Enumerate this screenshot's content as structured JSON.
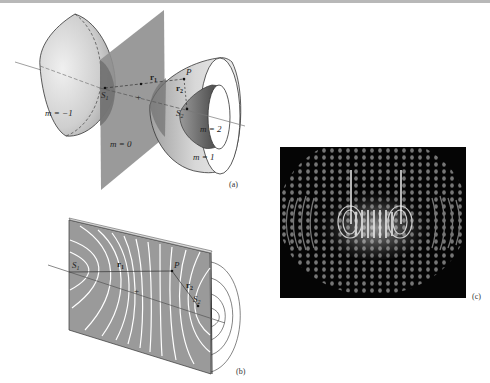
{
  "figure": {
    "panels": [
      {
        "id": "a",
        "label": "(a)",
        "description": "Hyperboloid surfaces of constant path difference between two sources",
        "surfaces": [
          {
            "m_label": "m = −1",
            "m": -1
          },
          {
            "m_label": "m = 0",
            "m": 0
          },
          {
            "m_label": "m = 1",
            "m": 1
          },
          {
            "m_label": "m = 2",
            "m": 2
          }
        ],
        "points": {
          "source1": "S",
          "source1_sub": "1",
          "source2": "S",
          "source2_sub": "2",
          "point": "P"
        },
        "vectors": {
          "r1": "r",
          "r1_sub": "1",
          "r2": "r",
          "r2_sub": "2"
        }
      },
      {
        "id": "b",
        "label": "(b)",
        "description": "Planar cross-section showing hyperbolic fringe lines",
        "points": {
          "source1": "S",
          "source1_sub": "1",
          "source2": "S",
          "source2_sub": "2",
          "point": "P"
        },
        "vectors": {
          "r1": "r",
          "r1_sub": "1",
          "r2": "r",
          "r2_sub": "2"
        }
      },
      {
        "id": "c",
        "label": "(c)",
        "description": "Two-source interference pattern intensity surface"
      }
    ],
    "colors": {
      "plane": "#8f8f8f",
      "surface_light": "#d6d6d6",
      "surface_dark": "#6e6e6e",
      "outline": "#333333",
      "fringe": "#ffffff",
      "panel_bg": "#9a9a9a",
      "pattern_bg": "#050505"
    }
  }
}
